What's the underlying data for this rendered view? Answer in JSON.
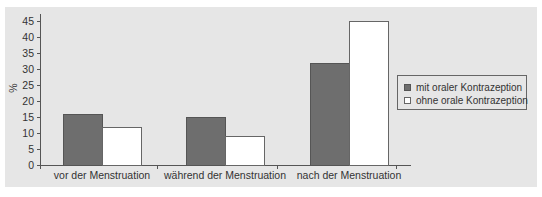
{
  "chart_data": {
    "type": "bar",
    "title": "",
    "xlabel": "",
    "ylabel": "%",
    "ylim": [
      0,
      45
    ],
    "yticks": [
      0,
      5,
      10,
      15,
      20,
      25,
      30,
      35,
      40,
      45
    ],
    "categories": [
      "vor der Menstruation",
      "während der Menstruation",
      "nach der Menstruation"
    ],
    "series": [
      {
        "name": "mit oraler Kontrazeption",
        "color": "#6e6e6e",
        "values": [
          16,
          15,
          32
        ]
      },
      {
        "name": "ohne orale Kontrazeption",
        "color": "#ffffff",
        "values": [
          12,
          9,
          45
        ]
      }
    ],
    "grid": false,
    "legend_position": "right"
  },
  "axis": {
    "ylabel": "%",
    "yticks": [
      "0",
      "5",
      "10",
      "15",
      "20",
      "25",
      "30",
      "35",
      "40",
      "45"
    ]
  },
  "categories": [
    "vor der Menstruation",
    "während der Menstruation",
    "nach der Menstruation"
  ],
  "legend": {
    "items": [
      {
        "label": "mit oraler Kontrazeption"
      },
      {
        "label": "ohne orale Kontrazeption"
      }
    ]
  }
}
